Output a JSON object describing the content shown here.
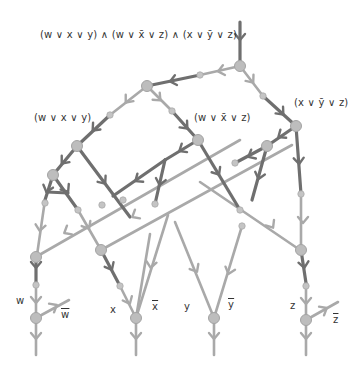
{
  "diagram": {
    "formula": "(w ∨ x ∨ y) ∧ (w ∨ x̄ ∨ z) ∧ (x ∨ ȳ ∨ z)",
    "clauses": [
      {
        "id": "c1",
        "label": "(w ∨ x ∨ y)"
      },
      {
        "id": "c2",
        "label": "(w ∨ x̄ ∨ z)"
      },
      {
        "id": "c3",
        "label": "(x ∨ ȳ ∨ z)"
      }
    ],
    "variables": [
      {
        "id": "w",
        "label": "w"
      },
      {
        "id": "w_neg",
        "label": "w"
      },
      {
        "id": "x",
        "label": "x"
      },
      {
        "id": "x_neg",
        "label": "x"
      },
      {
        "id": "y",
        "label": "y"
      },
      {
        "id": "y_neg",
        "label": "y"
      },
      {
        "id": "z",
        "label": "z"
      },
      {
        "id": "z_neg",
        "label": "z"
      }
    ],
    "colors": {
      "dark_edge": "#6e6e6e",
      "light_edge": "#a8a8a8",
      "node_fill": "#bdbdbd",
      "node_stroke": "#a0a0a0",
      "text": "#333333"
    }
  }
}
